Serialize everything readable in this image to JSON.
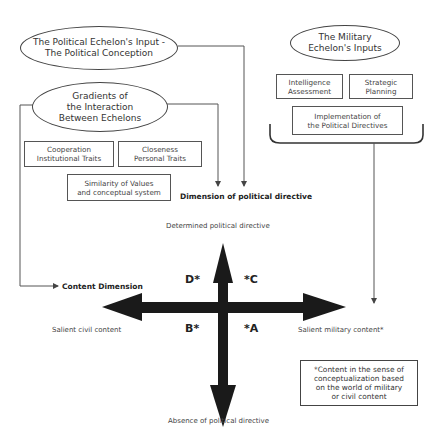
{
  "political_input": {
    "line1": "The Political Echelon's Input -",
    "line2": "The Political Conception"
  },
  "gradients": {
    "line1": "Gradients of",
    "line2": "the Interaction",
    "line3": "Between Echelons"
  },
  "gradient_boxes": {
    "cooperation": {
      "line1": "Cooperation",
      "line2": "Institutional Traits"
    },
    "closeness": {
      "line1": "Closeness",
      "line2": "Personal Traits"
    },
    "similarity": {
      "line1": "Similarity of Values",
      "line2": "and conceptual system"
    }
  },
  "military_inputs": {
    "line1": "The Military",
    "line2": "Echelon's Inputs"
  },
  "military_boxes": {
    "intelligence": {
      "line1": "Intelligence",
      "line2": "Assessment"
    },
    "strategic": {
      "line1": "Strategic",
      "line2": "Planning"
    },
    "implementation": {
      "line1": "Implementation of",
      "line2": "the Political Directives"
    }
  },
  "axes": {
    "political_dimension": "Dimension of political directive",
    "content_dimension": "Content Dimension",
    "top": "Determined political directive",
    "bottom": "Absence of political directive",
    "left": "Salient civil content",
    "right": "Salient military content*"
  },
  "quadrants": {
    "a": "*A",
    "b": "B*",
    "c": "*C",
    "d": "D*"
  },
  "footnote": {
    "line1": "*Content in the sense of",
    "line2": "conceptualization based",
    "line3": "on the world of military",
    "line4": "or civil content"
  },
  "colors": {
    "line": "#555555",
    "arrow": "#1a1a1a"
  }
}
